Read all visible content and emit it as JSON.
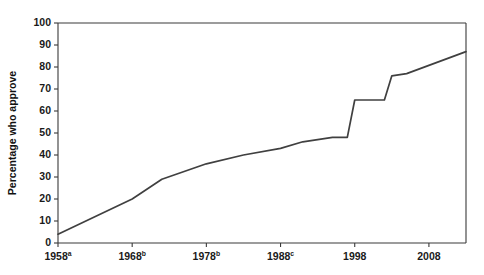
{
  "chart_data": {
    "type": "line",
    "title": "",
    "subtitle": "",
    "xlabel": "",
    "ylabel": "Percentage who approve",
    "xlim": [
      1958,
      2013
    ],
    "ylim": [
      0,
      100
    ],
    "grid": false,
    "legend": null,
    "y_ticks": [
      0,
      10,
      20,
      30,
      40,
      50,
      60,
      70,
      80,
      90,
      100
    ],
    "y_tick_labels": [
      "0",
      "10",
      "20",
      "30",
      "40",
      "50",
      "60",
      "70",
      "80",
      "90",
      "100"
    ],
    "x_ticks": [
      1958,
      1968,
      1978,
      1988,
      1998,
      2008
    ],
    "x_tick_labels": [
      {
        "text": "1958",
        "sup": "a"
      },
      {
        "text": "1968",
        "sup": "b"
      },
      {
        "text": "1978",
        "sup": "b"
      },
      {
        "text": "1988",
        "sup": "c"
      },
      {
        "text": "1998",
        "sup": ""
      },
      {
        "text": "2008",
        "sup": ""
      }
    ],
    "series": [
      {
        "name": "Percentage who approve",
        "color": "#404040",
        "x": [
          1958,
          1968,
          1972,
          1978,
          1983,
          1988,
          1991,
          1995,
          1997,
          1998,
          2002,
          2003,
          2005,
          2013
        ],
        "values": [
          4,
          20,
          29,
          36,
          40,
          43,
          46,
          48,
          48,
          65,
          65,
          76,
          77,
          87
        ]
      }
    ]
  },
  "axis_style": {
    "line_color": "#3a3a3a",
    "series_color": "#404040",
    "background": "#ffffff"
  }
}
